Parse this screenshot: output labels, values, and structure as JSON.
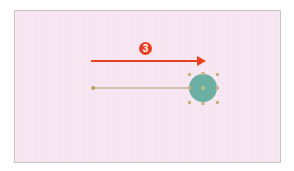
{
  "canvas": {
    "background": "#f7e4f1",
    "border": "#c8c2c6"
  },
  "step_badge": {
    "label": "3",
    "color": "#e8401f"
  },
  "motion_arrow": {
    "color": "#e8401f",
    "direction": "right"
  },
  "motion_path": {
    "color": "#a89a6a",
    "start_point_color": "#b8a45a"
  },
  "shape": {
    "type": "circle",
    "fill": "#6bb0a2",
    "selected": true,
    "handle_color": "#c9b27a"
  }
}
